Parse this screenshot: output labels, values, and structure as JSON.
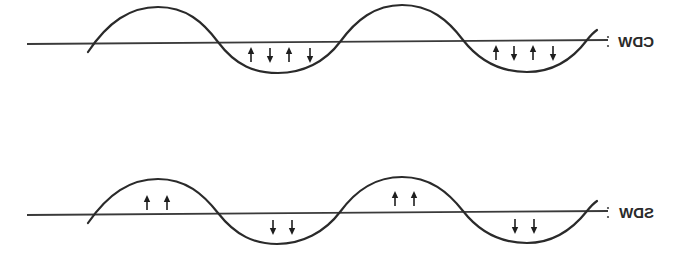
{
  "diagram": {
    "title": "",
    "mirrored_horizontally": true,
    "colors": {
      "line": "#2a2a2a",
      "background": "#ffffff"
    },
    "panels": [
      {
        "id": "cdw",
        "label": "CDW",
        "label_separator": ":",
        "description": "Charge density wave: sinusoidal modulation with paired up/down spins in troughs",
        "troughs": [
          {
            "arrows": [
              "up",
              "down",
              "up",
              "down"
            ]
          },
          {
            "arrows": [
              "up",
              "down",
              "up",
              "down"
            ]
          }
        ],
        "peaks": [
          {
            "arrows": []
          },
          {
            "arrows": []
          }
        ]
      },
      {
        "id": "sdw",
        "label": "SDW",
        "label_separator": ":",
        "description": "Spin density wave: up spins in peaks, down spins in troughs",
        "peaks": [
          {
            "arrows": [
              "up",
              "up"
            ]
          },
          {
            "arrows": [
              "up",
              "up"
            ]
          }
        ],
        "troughs": [
          {
            "arrows": [
              "down",
              "down"
            ]
          },
          {
            "arrows": [
              "down",
              "down"
            ]
          }
        ]
      }
    ]
  }
}
